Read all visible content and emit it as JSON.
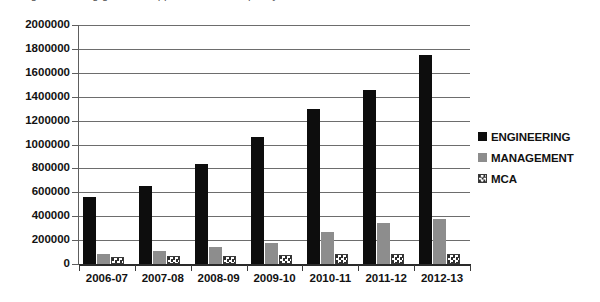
{
  "top_caption_clipped": "Figure showing growth in approved intake capacity",
  "legend": {
    "position": "right",
    "items": [
      {
        "label": "ENGINEERING",
        "color": "#0d0d0d",
        "swatch": "engineering-swatch"
      },
      {
        "label": "MANAGEMENT",
        "color": "#8d8d8d",
        "swatch": "management-swatch"
      },
      {
        "label": "MCA",
        "color": "#ffffff",
        "swatch": "mca-swatch"
      }
    ]
  },
  "axis": {
    "y_ticks": [
      "2000000",
      "1800000",
      "1600000",
      "1400000",
      "1200000",
      "1000000",
      "800000",
      "600000",
      "400000",
      "200000",
      "0"
    ],
    "x_ticks": [
      "2006-07",
      "2007-08",
      "2008-09",
      "2009-10",
      "2010-11",
      "2011-12",
      "2012-13"
    ]
  },
  "chart_data": {
    "type": "bar",
    "title": "",
    "xlabel": "",
    "ylabel": "",
    "ylim": [
      0,
      2000000
    ],
    "ytick_step": 200000,
    "grid": true,
    "legend_position": "right",
    "categories": [
      "2006-07",
      "2007-08",
      "2008-09",
      "2009-10",
      "2010-11",
      "2011-12",
      "2012-13"
    ],
    "series": [
      {
        "name": "ENGINEERING",
        "color": "#0d0d0d",
        "values": [
          560000,
          650000,
          835000,
          1060000,
          1300000,
          1460000,
          1750000
        ]
      },
      {
        "name": "MANAGEMENT",
        "color": "#8d8d8d",
        "values": [
          85000,
          110000,
          145000,
          175000,
          265000,
          345000,
          375000
        ]
      },
      {
        "name": "MCA",
        "color": "#ffffff",
        "values": [
          55000,
          65000,
          70000,
          72000,
          80000,
          82000,
          85000
        ]
      }
    ]
  }
}
